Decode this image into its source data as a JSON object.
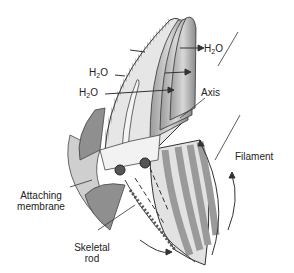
{
  "diagram": {
    "labels": {
      "water_out": {
        "main": "H",
        "sub": "2",
        "tail": "O"
      },
      "water_mid": {
        "main": "H",
        "sub": "2",
        "tail": "O"
      },
      "water_in": {
        "main": "H",
        "sub": "2",
        "tail": "O"
      },
      "axis": "Axis",
      "filament": "Filament",
      "attaching_membrane_1": "Attaching",
      "attaching_membrane_2": "membrane",
      "skeletal_rod_1": "Skeletal",
      "skeletal_rod_2": "rod"
    },
    "colors": {
      "line": "#333333",
      "fill_light": "#e4e4e4",
      "fill_mid": "#bdbdbd",
      "fill_dark": "#8a8a8a"
    }
  }
}
